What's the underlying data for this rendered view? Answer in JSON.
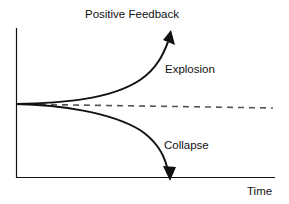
{
  "diagram": {
    "title": "Positive Feedback",
    "x_axis_label": "Time",
    "curves": [
      {
        "name": "explosion",
        "label": "Explosion",
        "direction": "up",
        "style": "solid",
        "arrowhead": true
      },
      {
        "name": "collapse",
        "label": "Collapse",
        "direction": "down",
        "style": "solid",
        "arrowhead": true
      },
      {
        "name": "baseline",
        "label": "",
        "direction": "flat",
        "style": "dashed",
        "arrowhead": false
      }
    ],
    "colors": {
      "line": "#111111",
      "dashed": "#555555",
      "background": "#ffffff"
    }
  }
}
